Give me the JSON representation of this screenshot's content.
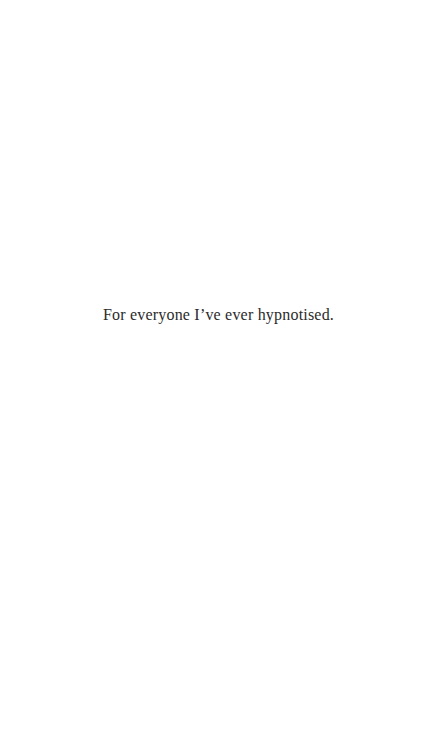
{
  "page": {
    "background_color": "#ffffff",
    "text_color": "#2b2b2b",
    "dedication_text": "For everyone I’ve ever hypnotised."
  }
}
